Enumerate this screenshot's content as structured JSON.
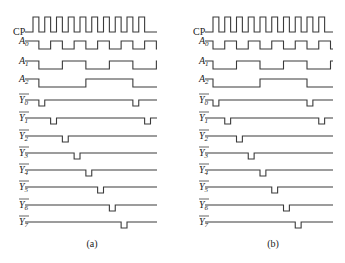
{
  "figure": {
    "panels": [
      {
        "id": "a",
        "caption": "(a)",
        "origin_x": 33,
        "unit": 11.75,
        "cycles": 10,
        "end_x": 157,
        "caption_x": 92
      },
      {
        "id": "b",
        "caption": "(b)",
        "origin_x": 213,
        "unit": 11.75,
        "cycles": 10,
        "end_x": 333,
        "caption_x": 273
      }
    ],
    "signals": [
      {
        "name": "CP",
        "label": "CP",
        "sub": "",
        "overbar": false,
        "y_high": 17,
        "y_low": 32
      },
      {
        "name": "A0",
        "label": "A",
        "sub": "0",
        "overbar": false,
        "y_high": 41,
        "y_low": 49
      },
      {
        "name": "A1",
        "label": "A",
        "sub": "1",
        "overbar": false,
        "y_high": 61,
        "y_low": 69
      },
      {
        "name": "A2",
        "label": "A",
        "sub": "2",
        "overbar": false,
        "y_high": 79,
        "y_low": 87
      },
      {
        "name": "Y0_n",
        "label": "Y",
        "sub": "0",
        "overbar": true,
        "y_high": 100,
        "y_low": 106
      },
      {
        "name": "Y1_n",
        "label": "Y",
        "sub": "1",
        "overbar": true,
        "y_high": 118,
        "y_low": 124
      },
      {
        "name": "Y2_n",
        "label": "Y",
        "sub": "2",
        "overbar": true,
        "y_high": 136,
        "y_low": 142
      },
      {
        "name": "Y3_n",
        "label": "Y",
        "sub": "3",
        "overbar": true,
        "y_high": 153,
        "y_low": 159
      },
      {
        "name": "Y4_n",
        "label": "Y",
        "sub": "4",
        "overbar": true,
        "y_high": 170,
        "y_low": 176
      },
      {
        "name": "Y5_n",
        "label": "Y",
        "sub": "5",
        "overbar": true,
        "y_high": 187,
        "y_low": 193
      },
      {
        "name": "Y6_n",
        "label": "Y",
        "sub": "6",
        "overbar": true,
        "y_high": 205,
        "y_low": 211
      },
      {
        "name": "Y7_n",
        "label": "Y",
        "sub": "7",
        "overbar": true,
        "y_high": 222,
        "y_low": 228
      }
    ],
    "caption_y": 247,
    "stroke_color": "#3a3a3a",
    "text_color": "#222222",
    "background": "#ffffff"
  }
}
